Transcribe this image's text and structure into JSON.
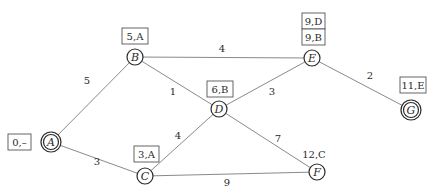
{
  "diagram": {
    "type": "weighted-graph-dijkstra",
    "nodes": [
      {
        "id": "A",
        "label": "A",
        "x": 51,
        "y": 142,
        "double_circle": true,
        "tag": "0,–",
        "tag_boxed": true
      },
      {
        "id": "B",
        "label": "B",
        "x": 135,
        "y": 57,
        "double_circle": false,
        "tag": "5,A",
        "tag_boxed": true
      },
      {
        "id": "C",
        "label": "C",
        "x": 145,
        "y": 176,
        "double_circle": false,
        "tag": "3,A",
        "tag_boxed": true
      },
      {
        "id": "D",
        "label": "D",
        "x": 219,
        "y": 109,
        "double_circle": false,
        "tag": "6,B",
        "tag_boxed": true
      },
      {
        "id": "E",
        "label": "E",
        "x": 312,
        "y": 58,
        "double_circle": false,
        "tag": "9,B",
        "tag_boxed": true,
        "tag_superseded": "9,D"
      },
      {
        "id": "F",
        "label": "F",
        "x": 317,
        "y": 172,
        "double_circle": false,
        "tag": "12,C",
        "tag_boxed": false
      },
      {
        "id": "G",
        "label": "G",
        "x": 411,
        "y": 110,
        "double_circle": true,
        "tag": "11,E",
        "tag_boxed": true
      }
    ],
    "edges": [
      {
        "from": "A",
        "to": "B",
        "weight": "5"
      },
      {
        "from": "A",
        "to": "C",
        "weight": "3"
      },
      {
        "from": "B",
        "to": "E",
        "weight": "4"
      },
      {
        "from": "B",
        "to": "D",
        "weight": "1"
      },
      {
        "from": "C",
        "to": "D",
        "weight": "4"
      },
      {
        "from": "C",
        "to": "F",
        "weight": "9"
      },
      {
        "from": "D",
        "to": "E",
        "weight": "3"
      },
      {
        "from": "D",
        "to": "F",
        "weight": "7"
      },
      {
        "from": "E",
        "to": "G",
        "weight": "2"
      }
    ]
  },
  "labels": {
    "A": "A",
    "B": "B",
    "C": "C",
    "D": "D",
    "E": "E",
    "F": "F",
    "G": "G"
  },
  "tags": {
    "A": "0,–",
    "B": "5,A",
    "C": "3,A",
    "D": "6,B",
    "E_top": "9,D",
    "E_bottom": "9,B",
    "F": "12,C",
    "G": "11,E"
  },
  "weights": {
    "AB": "5",
    "AC": "3",
    "BE": "4",
    "BD": "1",
    "CD": "4",
    "CF": "9",
    "DE": "3",
    "DF": "7",
    "EG": "2"
  }
}
